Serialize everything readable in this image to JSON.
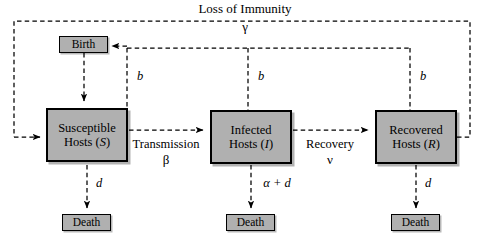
{
  "diagram": {
    "type": "flow-diagram",
    "colors": {
      "box_fill": "#b0b0b0",
      "box_border": "#000000",
      "line": "#000000",
      "background": "#ffffff"
    },
    "nodes": [
      {
        "id": "birth",
        "label_line1": "Birth",
        "label_line2": "",
        "symbol": "",
        "kind": "event"
      },
      {
        "id": "susceptible",
        "label_line1": "Susceptible",
        "label_line2": "Hosts",
        "symbol": "S",
        "kind": "compartment"
      },
      {
        "id": "infected",
        "label_line1": "Infected",
        "label_line2": "Hosts",
        "symbol": "I",
        "kind": "compartment"
      },
      {
        "id": "recovered",
        "label_line1": "Recovered",
        "label_line2": "Hosts",
        "symbol": "R",
        "kind": "compartment"
      },
      {
        "id": "death_s",
        "label_line1": "Death",
        "label_line2": "",
        "symbol": "",
        "kind": "event"
      },
      {
        "id": "death_i",
        "label_line1": "Death",
        "label_line2": "",
        "symbol": "",
        "kind": "event"
      },
      {
        "id": "death_r",
        "label_line1": "Death",
        "label_line2": "",
        "symbol": "",
        "kind": "event"
      }
    ],
    "flows": [
      {
        "id": "transmission",
        "name": "Transmission",
        "rate": "β",
        "from": "susceptible",
        "to": "infected"
      },
      {
        "id": "recovery",
        "name": "Recovery",
        "rate": "ν",
        "from": "infected",
        "to": "recovered"
      },
      {
        "id": "loss",
        "name": "Loss of Immunity",
        "rate": "γ",
        "from": "recovered",
        "to": "susceptible"
      },
      {
        "id": "death_rate_s",
        "name": "",
        "rate": "d",
        "from": "susceptible",
        "to": "death_s"
      },
      {
        "id": "death_rate_i",
        "name": "",
        "rate": "α + d",
        "from": "infected",
        "to": "death_i"
      },
      {
        "id": "death_rate_r",
        "name": "",
        "rate": "d",
        "from": "recovered",
        "to": "death_r"
      },
      {
        "id": "birth_s",
        "name": "",
        "rate": "b",
        "from": "susceptible",
        "to": "birth"
      },
      {
        "id": "birth_i",
        "name": "",
        "rate": "b",
        "from": "infected",
        "to": "birth"
      },
      {
        "id": "birth_r",
        "name": "",
        "rate": "b",
        "from": "recovered",
        "to": "birth"
      },
      {
        "id": "birth_in",
        "name": "",
        "rate": "",
        "from": "birth",
        "to": "susceptible"
      }
    ],
    "labels": {
      "loss_of_immunity": "Loss of Immunity",
      "gamma": "γ",
      "transmission": "Transmission",
      "beta": "β",
      "recovery": "Recovery",
      "nu": "ν",
      "alpha_plus_d": "α + d",
      "d_left": "d",
      "d_right": "d",
      "b_left": "b",
      "b_mid": "b",
      "b_right": "b"
    },
    "node_text": {
      "birth": "Birth",
      "death": "Death",
      "susceptible_l1": "Susceptible",
      "susceptible_l2": "Hosts (",
      "susceptible_sym": "S",
      "infected_l1": "Infected",
      "infected_l2": "Hosts (",
      "infected_sym": "I",
      "recovered_l1": "Recovered",
      "recovered_l2": "Hosts (",
      "recovered_sym": "R",
      "paren_close": ")"
    }
  }
}
